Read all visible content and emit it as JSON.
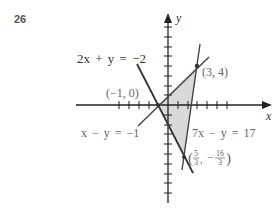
{
  "problem_number": "26",
  "axes": {
    "x_label": "x",
    "y_label": "y"
  },
  "lines": [
    {
      "equation": "2x + y = -2",
      "label": "2x + y = −2"
    },
    {
      "equation": "x - y = -1",
      "label": "x − y = −1"
    },
    {
      "equation": "7x - y = 17",
      "label": "7x − y = 17"
    }
  ],
  "vertices": [
    {
      "x": -1,
      "y": 0,
      "label": "(−1, 0)"
    },
    {
      "x": 3,
      "y": 4,
      "label": "(3, 4)"
    },
    {
      "x": "5/3",
      "y": "-16/3",
      "label": "(5/3, −16/3)",
      "num_x": "5",
      "den_x": "3",
      "num_y": "16",
      "den_y": "3"
    }
  ],
  "region": {
    "fill": "#d9d9d9",
    "description": "shaded triangle bounded by the three lines"
  },
  "colors": {
    "line": "#333333",
    "axis": "#222222",
    "fill": "#d9d9d9"
  }
}
